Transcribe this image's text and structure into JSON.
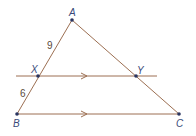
{
  "diagram": {
    "type": "triangle-with-parallel-line",
    "colors": {
      "line": "#9c6f52",
      "point": "#2a3560",
      "label": "#3a4a7a",
      "measure": "#5a4a3a"
    },
    "points": {
      "A": {
        "label": "A",
        "x": 72,
        "y": 20
      },
      "B": {
        "label": "B",
        "x": 17,
        "y": 114
      },
      "C": {
        "label": "C",
        "x": 179,
        "y": 114
      },
      "X": {
        "label": "X",
        "x": 38,
        "y": 76
      },
      "Y": {
        "label": "Y",
        "x": 136,
        "y": 76
      }
    },
    "segments": {
      "AX": {
        "label": "9"
      },
      "XB": {
        "label": "6"
      }
    },
    "parallel_note": "XY ∥ BC"
  }
}
